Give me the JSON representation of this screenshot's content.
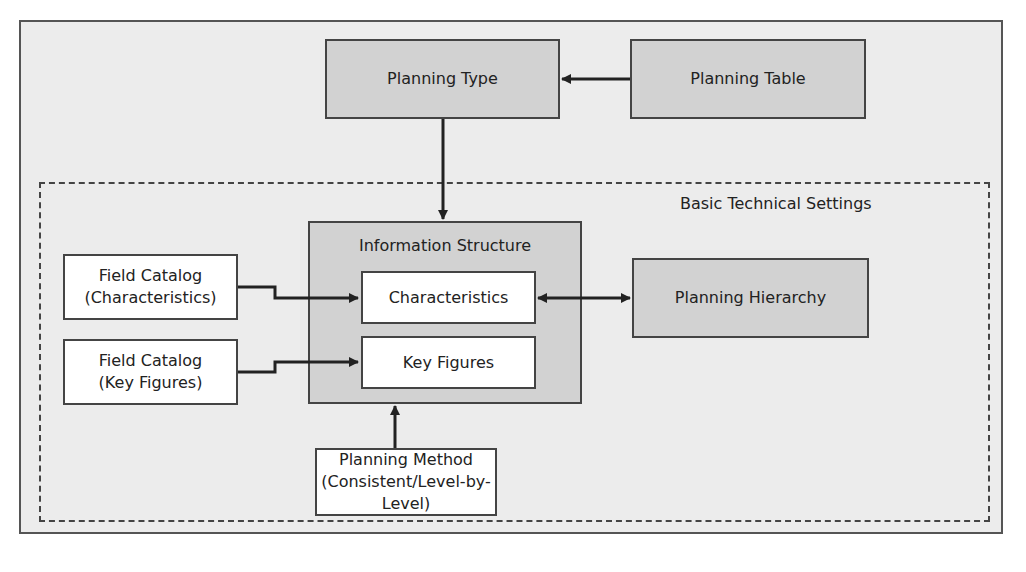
{
  "diagram": {
    "nodes": {
      "planning_type": "Planning Type",
      "planning_table": "Planning Table",
      "group_label": "Basic Technical Settings",
      "information_structure": "Information Structure",
      "characteristics": "Characteristics",
      "key_figures": "Key Figures",
      "planning_hierarchy": "Planning Hierarchy",
      "field_catalog_char_line1": "Field Catalog",
      "field_catalog_char_line2": "(Characteristics)",
      "field_catalog_kf_line1": "Field Catalog",
      "field_catalog_kf_line2": "(Key Figures)",
      "planning_method_line1": "Planning Method",
      "planning_method_line2": "(Consistent/Level-by-Level)"
    },
    "edges": [
      {
        "from": "Planning Table",
        "to": "Planning Type"
      },
      {
        "from": "Planning Type",
        "to": "Information Structure"
      },
      {
        "from": "Field Catalog (Characteristics)",
        "to": "Characteristics"
      },
      {
        "from": "Field Catalog (Key Figures)",
        "to": "Key Figures"
      },
      {
        "from": "Characteristics",
        "to": "Planning Hierarchy",
        "bidirectional": true
      },
      {
        "from": "Planning Method",
        "to": "Information Structure"
      }
    ]
  }
}
